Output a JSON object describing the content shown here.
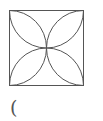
{
  "figure": {
    "square": {
      "x": 9,
      "y": 10,
      "size": 74
    },
    "stroke_color": "#555555",
    "background": "#ffffff"
  },
  "label": {
    "text": "("
  }
}
